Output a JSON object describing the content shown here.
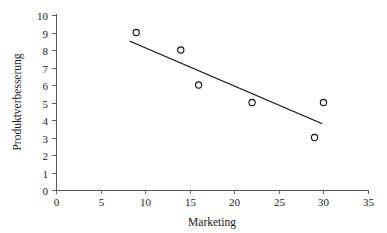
{
  "chart_data": {
    "type": "scatter",
    "title": "",
    "xlabel": "Marketing",
    "ylabel": "Produktverbesserung",
    "xlim": [
      0,
      35
    ],
    "ylim": [
      0,
      10
    ],
    "xticks": [
      0,
      5,
      10,
      15,
      20,
      25,
      30,
      35
    ],
    "yticks": [
      0,
      1,
      2,
      3,
      4,
      5,
      6,
      7,
      8,
      9,
      10
    ],
    "xtick_labels": [
      "0",
      "5",
      "10",
      "15",
      "20",
      "25",
      "30",
      "35"
    ],
    "ytick_labels": [
      "0",
      "1",
      "2",
      "3",
      "4",
      "5",
      "6",
      "7",
      "8",
      "9",
      "10"
    ],
    "grid": false,
    "legend": null,
    "marker_style": "open-circle",
    "series": [
      {
        "name": "Beobachtungen",
        "x": [
          9,
          14,
          16,
          22,
          29,
          30
        ],
        "y": [
          9,
          8,
          6,
          5,
          3,
          5
        ]
      }
    ],
    "trendline": {
      "type": "linear-fit",
      "x_start": 8.3,
      "y_start": 8.5,
      "x_end": 29.8,
      "y_end": 3.8,
      "color": "#111111"
    },
    "colors": {
      "marker": "#111111",
      "trendline": "#111111",
      "axis": "#555555",
      "background": "#ffffff",
      "text": "#1a1a1a"
    }
  }
}
